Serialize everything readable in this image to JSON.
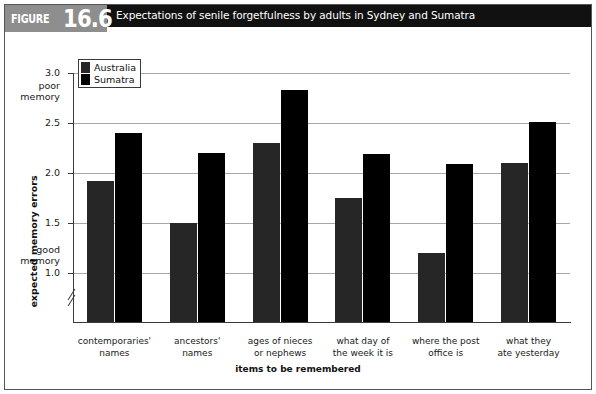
{
  "figure": {
    "label": "FIGURE",
    "number": "16.6",
    "caption": "Expectations of senile forgetfulness by adults in Sydney and Sumatra"
  },
  "legend": {
    "position": "top-left-inside",
    "items": [
      {
        "label": "Australia",
        "color": "#262626"
      },
      {
        "label": "Sumatra",
        "color": "#000000"
      }
    ]
  },
  "annotations": {
    "poor_memory_line1": "poor",
    "poor_memory_line2": "memory",
    "good_memory_line1": "good",
    "good_memory_line2": "memory"
  },
  "chart_data": {
    "type": "bar",
    "title": "Expectations of senile forgetfulness by adults in Sydney and Sumatra",
    "xlabel": "items to be remembered",
    "ylabel": "expected memory errors",
    "categories": [
      "contemporaries' names",
      "ancestors' names",
      "ages of nieces or nephews",
      "what day of the week it is",
      "where the post office is",
      "what they ate yesterday"
    ],
    "category_lines": [
      [
        "contemporaries'",
        "names"
      ],
      [
        "ancestors'",
        "names"
      ],
      [
        "ages of nieces",
        "or nephews"
      ],
      [
        "what day of",
        "the week it is"
      ],
      [
        "where the post",
        "office is"
      ],
      [
        "what they",
        "ate yesterday"
      ]
    ],
    "series": [
      {
        "name": "Australia",
        "color": "#262626",
        "values": [
          1.92,
          1.5,
          2.3,
          1.75,
          1.2,
          2.1
        ]
      },
      {
        "name": "Sumatra",
        "color": "#000000",
        "values": [
          2.4,
          2.2,
          2.83,
          2.19,
          2.09,
          2.51
        ]
      }
    ],
    "ylim": [
      0.75,
      3.0
    ],
    "yticks": [
      1.0,
      1.5,
      2.0,
      2.5,
      3.0
    ],
    "ytick_labels": [
      "1.0",
      "1.5",
      "2.0",
      "2.5",
      "3.0"
    ],
    "grid": true,
    "y_axis_break": true,
    "legend_position": "upper left"
  }
}
